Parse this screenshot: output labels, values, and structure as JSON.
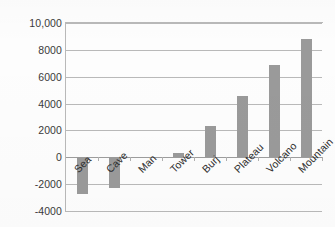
{
  "chart_data": {
    "type": "bar",
    "title": "",
    "subtitle": "",
    "xlabel": "",
    "ylabel": "",
    "categories": [
      "Sea",
      "Cave",
      "Man",
      "Tower",
      "Burj",
      "Plateau",
      "Volcano",
      "Mountain"
    ],
    "values": [
      -2700,
      -2300,
      0,
      300,
      2300,
      4600,
      6900,
      8800
    ],
    "series": [
      {
        "name": "",
        "values": [
          -2700,
          -2300,
          0,
          300,
          2300,
          4600,
          6900,
          8800
        ]
      }
    ],
    "ylim": [
      -4000,
      10000
    ],
    "ytick_labels": [
      "10,000",
      "8000",
      "6000",
      "4000",
      "2000",
      "0",
      "-2000",
      "-4000"
    ],
    "ytick_values": [
      10000,
      8000,
      6000,
      4000,
      2000,
      0,
      -2000,
      -4000
    ],
    "grid": "horizontal",
    "legend": "none",
    "bar_color": "#9a9a9a",
    "gridline_color": "#b9b9b9",
    "axis_text_color": "#3a3a3a",
    "category_label_rotation": -45
  }
}
